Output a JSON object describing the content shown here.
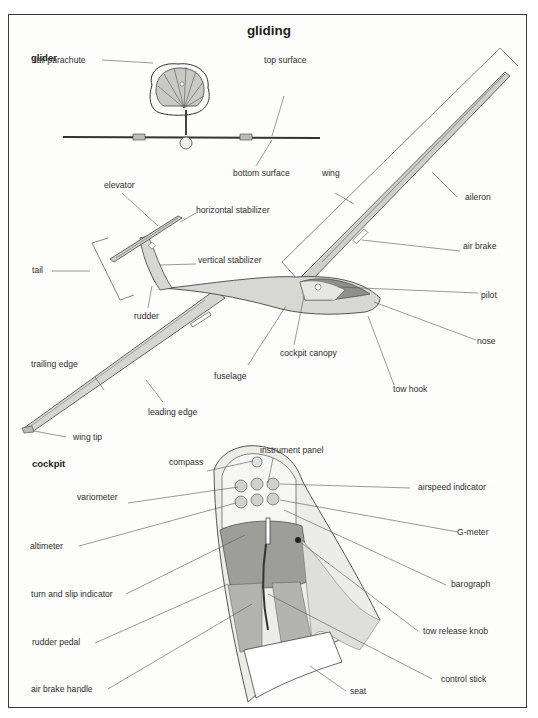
{
  "title": "gliding",
  "sections": {
    "glider": {
      "heading": "glider",
      "labels": {
        "tail_parachute": "tail parachute",
        "top_surface": "top surface",
        "bottom_surface": "bottom surface",
        "wing": "wing",
        "aileron": "aileron",
        "elevator": "elevator",
        "horizontal_stabilizer": "horizontal stabilizer",
        "air_brake": "air brake",
        "vertical_stabilizer": "vertical stabilizer",
        "tail": "tail",
        "pilot": "pilot",
        "rudder": "rudder",
        "nose": "nose",
        "cockpit_canopy": "cockpit canopy",
        "trailing_edge": "trailing edge",
        "fuselage": "fuselage",
        "tow_hook": "tow hook",
        "leading_edge": "leading edge",
        "wing_tip": "wing tip"
      }
    },
    "cockpit": {
      "heading": "cockpit",
      "labels": {
        "instrument_panel": "instrument panel",
        "compass": "compass",
        "airspeed_indicator": "airspeed indicator",
        "variometer": "variometer",
        "g_meter": "G-meter",
        "altimeter": "altimeter",
        "barograph": "barograph",
        "turn_and_slip_indicator": "turn and slip indicator",
        "rudder_pedal": "rudder pedal",
        "tow_release_knob": "tow release knob",
        "air_brake_handle": "air brake handle",
        "control_stick": "control stick",
        "seat": "seat"
      }
    }
  },
  "colors": {
    "frame": "#3a3a3a",
    "surface_light": "#d9d9d6",
    "surface_mid": "#b8b8b4",
    "surface_dark": "#8e8e8a",
    "line": "#444444"
  }
}
